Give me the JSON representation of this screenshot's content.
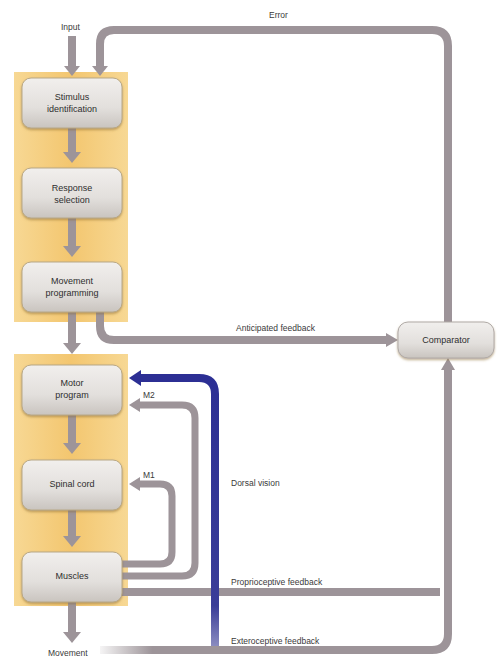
{
  "labels": {
    "input": "Input",
    "error": "Error",
    "anticipated_feedback": "Anticipated feedback",
    "m2": "M2",
    "m1": "M1",
    "dorsal_vision": "Dorsal vision",
    "proprioceptive_feedback": "Proprioceptive feedback",
    "exteroceptive_feedback": "Exteroceptive feedback",
    "movement": "Movement"
  },
  "boxes": {
    "stimulus_identification": {
      "line1": "Stimulus",
      "line2": "identification"
    },
    "response_selection": {
      "line1": "Response",
      "line2": "selection"
    },
    "movement_programming": {
      "line1": "Movement",
      "line2": "programming"
    },
    "motor_program": {
      "line1": "Motor",
      "line2": "program"
    },
    "spinal_cord": {
      "line1": "Spinal cord"
    },
    "muscles": {
      "line1": "Muscles"
    },
    "comparator": {
      "line1": "Comparator"
    }
  },
  "colors": {
    "panel": "#f5c97a",
    "box": "#e4e2e0",
    "arrow_gray": "#9d9499",
    "arrow_blue": "#2c2f94",
    "text": "#333333"
  }
}
